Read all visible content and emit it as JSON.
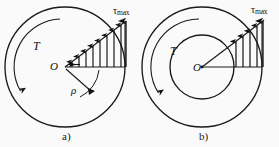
{
  "figure": {
    "background_color": "#fafafa",
    "stroke_color": "#1a1a1a",
    "panels": [
      {
        "id": "a",
        "caption": "a)",
        "kind": "solid-shaft",
        "center_label": "O",
        "torque_label": "T",
        "radius_label": "ρ",
        "stress_label_main": "τ",
        "stress_label_sub": "max",
        "outer_circle": {
          "cx": 65,
          "cy": 67,
          "r": 60
        },
        "inner_circle": null,
        "baseline": {
          "x1": 65,
          "y1": 67,
          "x2": 125,
          "y2": 67
        },
        "hypotenuse": {
          "x1": 65,
          "y1": 67,
          "x2": 125,
          "y2": 22
        },
        "arrow_count": 9,
        "torque_arc_direction": "counterclockwise",
        "rho_arc": true
      },
      {
        "id": "b",
        "caption": "b)",
        "kind": "hollow-shaft",
        "center_label": "O",
        "torque_label": "T",
        "radius_label": "",
        "stress_label_main": "τ",
        "stress_label_sub": "max",
        "outer_circle": {
          "cx": 202,
          "cy": 67,
          "r": 60
        },
        "inner_circle": {
          "cx": 202,
          "cy": 67,
          "r": 32
        },
        "baseline": {
          "x1": 202,
          "y1": 67,
          "x2": 262,
          "y2": 67
        },
        "hypotenuse": {
          "x1": 202,
          "y1": 67,
          "x2": 262,
          "y2": 22
        },
        "arrow_count": 5,
        "torque_arc_direction": "counterclockwise",
        "rho_arc": false
      }
    ]
  }
}
